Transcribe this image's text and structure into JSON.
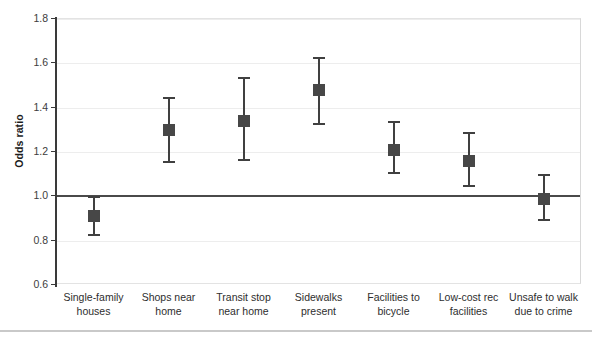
{
  "chart_data": {
    "type": "scatter",
    "title": "",
    "xlabel": "",
    "ylabel": "Odds ratio",
    "ylim": [
      0.6,
      1.8
    ],
    "yticks": [
      "1.8",
      "1.6",
      "1.4",
      "1.2",
      "1.0",
      "0.8",
      "0.6"
    ],
    "ytick_values": [
      1.8,
      1.6,
      1.4,
      1.2,
      1.0,
      0.8,
      0.6
    ],
    "grid": true,
    "gridlines_at": [
      1.8,
      1.6,
      1.4,
      1.2,
      0.8
    ],
    "reference_line": 1.0,
    "legend": "none",
    "categories": [
      "Single-family houses",
      "Shops near home",
      "Transit stop near home",
      "Sidewalks present",
      "Facilities to bicycle",
      "Low-cost rec facilities",
      "Unsafe to walk due to crime"
    ],
    "category_lines": [
      [
        "Single-family",
        "houses"
      ],
      [
        "Shops near",
        "home"
      ],
      [
        "Transit stop",
        "near home"
      ],
      [
        "Sidewalks",
        "present"
      ],
      [
        "Facilities to",
        "bicycle"
      ],
      [
        "Low-cost rec",
        "facilities"
      ],
      [
        "Unsafe to walk",
        "due to crime"
      ]
    ],
    "values": [
      0.91,
      1.3,
      1.34,
      1.48,
      1.21,
      1.16,
      0.99
    ],
    "ci_lower": [
      0.82,
      1.15,
      1.16,
      1.32,
      1.1,
      1.04,
      0.89
    ],
    "ci_upper": [
      1.0,
      1.45,
      1.54,
      1.63,
      1.34,
      1.29,
      1.1
    ],
    "points": [
      {
        "category": "Single-family houses",
        "value": 0.91,
        "low": 0.82,
        "high": 1.0
      },
      {
        "category": "Shops near home",
        "value": 1.3,
        "low": 1.15,
        "high": 1.45
      },
      {
        "category": "Transit stop near home",
        "value": 1.34,
        "low": 1.16,
        "high": 1.54
      },
      {
        "category": "Sidewalks present",
        "value": 1.48,
        "low": 1.32,
        "high": 1.63
      },
      {
        "category": "Facilities to bicycle",
        "value": 1.21,
        "low": 1.1,
        "high": 1.34
      },
      {
        "category": "Low-cost rec facilities",
        "value": 1.16,
        "low": 1.04,
        "high": 1.29
      },
      {
        "category": "Unsafe to walk due to crime",
        "value": 0.99,
        "low": 0.89,
        "high": 1.1
      }
    ],
    "colors": {
      "marker": "#474747",
      "whisker": "#404040",
      "gridline": "#ededed",
      "reference_line": "#4a4a4a",
      "axis": "#3a3a3a",
      "text": "#2e2e2e",
      "background": "#ffffff"
    }
  }
}
